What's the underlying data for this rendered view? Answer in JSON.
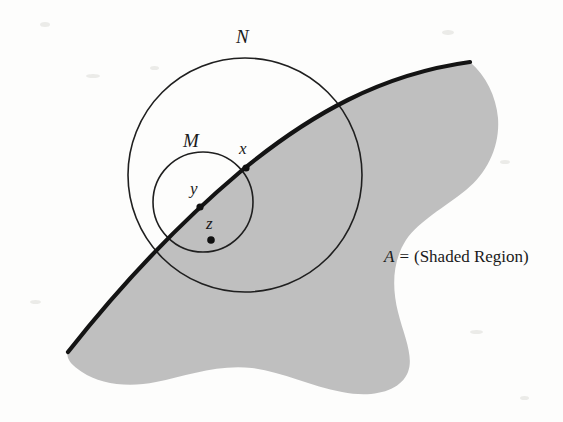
{
  "figure": {
    "background_color": "#fdfdfc",
    "ink_color": "#1a1a1a",
    "shaded_fill_color": "#bfbfbf",
    "labels": {
      "outer_circle": "N",
      "inner_circle": "M",
      "point_x": "x",
      "point_y": "y",
      "point_z": "z",
      "caption_symbol": "A",
      "caption_equals": "=",
      "caption_text": "(Shaded Region)"
    },
    "geometry": {
      "outer_circle": {
        "cx": 245,
        "cy": 175,
        "r": 117,
        "stroke_width": 1.6
      },
      "inner_circle": {
        "cx": 203,
        "cy": 202,
        "r": 50,
        "stroke_width": 1.6
      },
      "boundary_curve_stroke_width": 4.2,
      "points": [
        {
          "name": "x",
          "cx": 246,
          "cy": 168,
          "r": 3.6,
          "label_dx": -5,
          "label_dy": -22
        },
        {
          "name": "y",
          "cx": 200,
          "cy": 207,
          "r": 3.6,
          "label_dx": -7,
          "label_dy": -22
        },
        {
          "name": "z",
          "cx": 211,
          "cy": 240,
          "r": 3.8,
          "label_dx": -4,
          "label_dy": -21
        }
      ]
    }
  }
}
